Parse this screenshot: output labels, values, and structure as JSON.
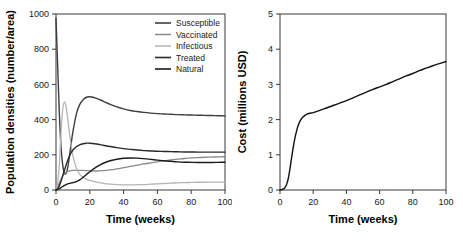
{
  "figure": {
    "background_color": "#ffffff",
    "axis_color": "#3a3a3a"
  },
  "chart_data": [
    {
      "type": "line",
      "panel": "left",
      "title": "",
      "xlabel": "Time (weeks)",
      "ylabel": "Population densities (number/area)",
      "xlim": [
        0,
        100
      ],
      "ylim": [
        0,
        1000
      ],
      "xticks": [
        0,
        20,
        40,
        60,
        80,
        100
      ],
      "yticks": [
        0,
        200,
        400,
        600,
        800,
        1000
      ],
      "xticklabels": [
        "0",
        "20",
        "40",
        "60",
        "80",
        "100"
      ],
      "yticklabels": [
        "0",
        "200",
        "400",
        "600",
        "800",
        "1000"
      ],
      "grid": false,
      "legend_position": "top-right",
      "x": [
        0,
        1,
        2,
        3,
        4,
        5,
        6,
        7,
        8,
        9,
        10,
        12,
        14,
        16,
        18,
        20,
        24,
        28,
        32,
        36,
        40,
        44,
        48,
        52,
        56,
        60,
        64,
        68,
        72,
        76,
        80,
        84,
        88,
        92,
        96,
        100
      ],
      "series": [
        {
          "name": "Susceptible",
          "color": "#3d3d3d",
          "width": 1.4,
          "values": [
            975,
            700,
            430,
            240,
            140,
            95,
            95,
            130,
            195,
            265,
            330,
            430,
            485,
            512,
            527,
            530,
            521,
            504,
            487,
            472,
            461,
            452,
            446,
            441,
            437,
            434,
            432,
            430,
            428,
            427,
            426,
            425,
            424,
            423,
            422,
            421
          ]
        },
        {
          "name": "Vaccinated",
          "color": "#8a8a8a",
          "width": 1.3,
          "values": [
            0,
            18,
            40,
            62,
            80,
            93,
            100,
            105,
            108,
            110,
            111,
            112,
            112,
            111,
            110,
            109,
            108,
            110,
            114,
            120,
            127,
            134,
            141,
            148,
            154,
            160,
            166,
            171,
            175,
            179,
            182,
            184,
            186,
            187,
            188,
            189
          ]
        },
        {
          "name": "Infectious",
          "color": "#b5b5b5",
          "width": 1.3,
          "values": [
            2,
            40,
            150,
            330,
            460,
            500,
            470,
            400,
            320,
            250,
            195,
            125,
            90,
            72,
            62,
            55,
            45,
            38,
            33,
            30,
            29,
            29,
            30,
            31,
            33,
            35,
            37,
            39,
            41,
            42,
            43,
            44,
            44,
            45,
            45,
            45
          ]
        },
        {
          "name": "Treated",
          "color": "#2b2b2b",
          "width": 1.4,
          "values": [
            0,
            8,
            25,
            50,
            82,
            112,
            142,
            170,
            193,
            212,
            227,
            246,
            257,
            263,
            266,
            266,
            261,
            254,
            247,
            241,
            235,
            231,
            227,
            224,
            222,
            220,
            219,
            218,
            217,
            216,
            216,
            215,
            215,
            215,
            215,
            215
          ]
        },
        {
          "name": "Natural",
          "color": "#1a1a1a",
          "width": 1.4,
          "values": [
            0,
            3,
            8,
            14,
            20,
            26,
            31,
            35,
            38,
            40,
            42,
            48,
            58,
            72,
            88,
            104,
            131,
            152,
            166,
            175,
            180,
            182,
            181,
            178,
            174,
            170,
            166,
            163,
            160,
            158,
            157,
            156,
            156,
            156,
            157,
            158
          ]
        }
      ]
    },
    {
      "type": "line",
      "panel": "right",
      "title": "",
      "xlabel": "Time (weeks)",
      "ylabel": "Cost (millions USD)",
      "xlim": [
        0,
        100
      ],
      "ylim": [
        0,
        5
      ],
      "xticks": [
        0,
        20,
        40,
        60,
        80,
        100
      ],
      "yticks": [
        0,
        1,
        2,
        3,
        4,
        5
      ],
      "xticklabels": [
        "0",
        "20",
        "40",
        "60",
        "80",
        "100"
      ],
      "yticklabels": [
        "0",
        "1",
        "2",
        "3",
        "4",
        "5"
      ],
      "grid": false,
      "legend_position": "none",
      "x": [
        0,
        1,
        2,
        3,
        4,
        5,
        6,
        7,
        8,
        9,
        10,
        11,
        12,
        13,
        14,
        15,
        16,
        18,
        20,
        24,
        28,
        32,
        36,
        40,
        44,
        48,
        52,
        56,
        60,
        64,
        68,
        72,
        76,
        80,
        84,
        88,
        92,
        96,
        100
      ],
      "series": [
        {
          "name": "Cost",
          "color": "#111111",
          "width": 1.4,
          "values": [
            0.0,
            0.01,
            0.03,
            0.07,
            0.16,
            0.33,
            0.6,
            0.92,
            1.22,
            1.48,
            1.68,
            1.84,
            1.95,
            2.03,
            2.08,
            2.12,
            2.15,
            2.18,
            2.2,
            2.26,
            2.33,
            2.4,
            2.47,
            2.54,
            2.62,
            2.7,
            2.78,
            2.86,
            2.93,
            3.0,
            3.08,
            3.16,
            3.24,
            3.31,
            3.39,
            3.46,
            3.53,
            3.59,
            3.65
          ]
        }
      ]
    }
  ]
}
